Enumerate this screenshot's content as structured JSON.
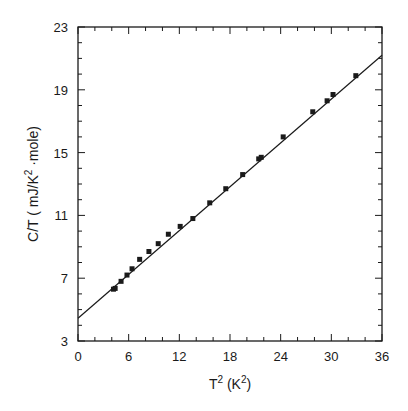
{
  "chart_data": {
    "type": "scatter",
    "title": "",
    "xlabel": "T^2 (K^2)",
    "ylabel": "C/T ( mJ/K^2 ·mole)",
    "xlim": [
      0,
      36
    ],
    "ylim": [
      3,
      23
    ],
    "x_ticks": [
      0,
      6,
      12,
      18,
      24,
      30,
      36
    ],
    "y_ticks": [
      3,
      7,
      11,
      15,
      19,
      23
    ],
    "x_minor_step": 2,
    "y_minor_step": 1,
    "grid": false,
    "legend": null,
    "series": [
      {
        "name": "data",
        "marker": "square",
        "x": [
          4.2,
          4.4,
          5.1,
          5.8,
          6.4,
          7.3,
          8.4,
          9.5,
          10.7,
          12.1,
          13.6,
          15.6,
          17.5,
          19.5,
          21.4,
          21.7,
          24.3,
          27.8,
          29.5,
          30.2,
          32.9
        ],
        "y": [
          6.3,
          6.35,
          6.8,
          7.2,
          7.6,
          8.2,
          8.7,
          9.2,
          9.8,
          10.3,
          10.8,
          11.8,
          12.7,
          13.6,
          14.6,
          14.7,
          16.0,
          17.6,
          18.3,
          18.7,
          19.9
        ]
      },
      {
        "name": "linear fit",
        "type": "line",
        "intercept": 4.45,
        "slope": 0.465,
        "x": [
          0,
          36
        ],
        "y": [
          4.45,
          21.2
        ]
      }
    ]
  },
  "labels": {
    "x_axis_main": "T",
    "x_axis_sup": "2",
    "x_axis_unit_open": " (K",
    "x_axis_unit_sup": "2",
    "x_axis_unit_close": ")",
    "y_axis_main": "C/T ( mJ/K",
    "y_axis_sup": "2",
    "y_axis_rest": " ·mole)"
  }
}
